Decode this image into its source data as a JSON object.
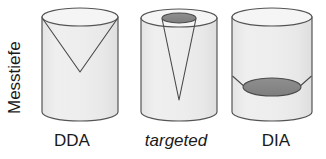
{
  "figure": {
    "axis_label": "Messtiefe",
    "background_color": "#ffffff",
    "stroke_color": "#555555",
    "body_fill": "#ececec",
    "top_fill": "#f4f4f4",
    "dark_fill": "#8a8a8a",
    "text_color": "#1a1a1a"
  },
  "panels": [
    {
      "id": "dda",
      "label": "DDA",
      "label_style": "normal",
      "label_x": 72,
      "label_y": 146,
      "cylinder": {
        "cx": 80,
        "top_y": 17,
        "bottom_y": 112,
        "rx": 38,
        "ry": 9
      },
      "coverage": {
        "shape": "wide-cone",
        "mouth_rx": 38,
        "apex_y": 72,
        "fill": "none",
        "description": "wide inverted cone spanning full cylinder width, apex at mid depth"
      }
    },
    {
      "id": "targeted",
      "label": "targeted",
      "label_style": "italic",
      "label_x": 176,
      "label_y": 146,
      "cylinder": {
        "cx": 179,
        "top_y": 18,
        "bottom_y": 112,
        "rx": 38,
        "ry": 9
      },
      "coverage": {
        "shape": "narrow-cone",
        "mouth_rx": 17,
        "mouth_ry": 5,
        "mouth_cy": 18,
        "apex_y": 100,
        "fill": "#8a8a8a",
        "description": "narrow dark ellipse at surface with thin deep cone"
      }
    },
    {
      "id": "dia",
      "label": "DIA",
      "label_style": "normal",
      "label_x": 276,
      "label_y": 146,
      "cylinder": {
        "cx": 272,
        "top_y": 17,
        "bottom_y": 112,
        "rx": 40,
        "ry": 9
      },
      "coverage": {
        "shape": "wide-shallow-disc",
        "disc_rx": 29,
        "disc_ry": 9,
        "disc_cy": 87,
        "shoulder_y": 76,
        "fill": "#8a8a8a",
        "description": "broad dark ellipse deep in cylinder with shallow walls"
      }
    }
  ]
}
